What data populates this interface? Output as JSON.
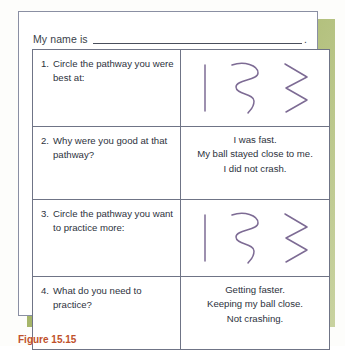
{
  "worksheet": {
    "name_line": {
      "label": "My name is",
      "blank_value": "",
      "trailing_punctuation": "."
    },
    "rows": [
      {
        "type": "pathway",
        "question_number": "1.",
        "question_text": "Circle the pathway you were best at:",
        "answer_kind": "pathway-shapes",
        "pathways": [
          "straight",
          "curvy",
          "zigzag"
        ]
      },
      {
        "type": "answer",
        "question_number": "2.",
        "question_text": "Why were you good at that pathway?",
        "answer_kind": "handwritten-text",
        "answer_lines": [
          "I was fast.",
          "My ball stayed close to me.",
          "I did not crash."
        ]
      },
      {
        "type": "pathway",
        "question_number": "3.",
        "question_text": "Circle the pathway you want to practice more:",
        "answer_kind": "pathway-shapes",
        "pathways": [
          "straight",
          "curvy",
          "zigzag"
        ]
      },
      {
        "type": "answer",
        "question_number": "4.",
        "question_text": "What do you need to practice?",
        "answer_kind": "handwritten-text",
        "answer_lines": [
          "Getting faster.",
          "Keeping my ball close.",
          "Not crashing."
        ]
      }
    ]
  },
  "caption": {
    "label": "Figure 15.15",
    "text": ""
  },
  "colors": {
    "card_background": "#ffffff",
    "card_border": "#8a8fa3",
    "table_border": "#6f7486",
    "text": "#2d323d",
    "pathway_stroke": "#7d6b94",
    "shadow_green": "#94a74e",
    "caption_accent": "#c0512b"
  }
}
